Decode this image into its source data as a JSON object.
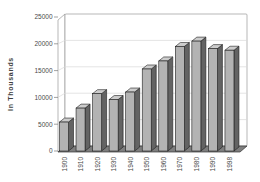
{
  "chart_data": {
    "type": "bar",
    "style": "3d-column",
    "title": "",
    "xlabel": "",
    "ylabel": "In Thousands",
    "categories": [
      "1900",
      "1910",
      "1920",
      "1930",
      "1940",
      "1950",
      "1960",
      "1970",
      "1980",
      "1990",
      "1998"
    ],
    "values": [
      5400,
      8000,
      10700,
      9600,
      11000,
      15300,
      16800,
      19500,
      20500,
      19100,
      18800
    ],
    "ylim": [
      0,
      25000
    ],
    "ytick_interval": 5000,
    "ytick_labels": [
      "0",
      "5000",
      "10000",
      "15000",
      "20000",
      "25000"
    ],
    "grid": true,
    "legend": "none"
  },
  "colors": {
    "background": "#ffffff",
    "bar_front": "#b3b3b3",
    "bar_top": "#cccccc",
    "bar_side": "#636363",
    "bar_outline": "#1f1f1f",
    "floor": "#7e7e7e",
    "floor_outline": "#333333",
    "wall_fill": "#ffffff",
    "wall_outline": "#9a9a9a",
    "gridline": "#d9d9d9",
    "tick": "#7a7a7a",
    "text": "#4a4a4a"
  }
}
